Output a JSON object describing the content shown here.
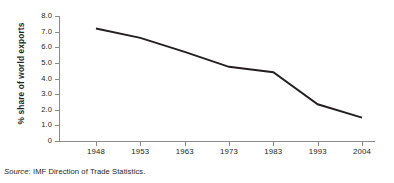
{
  "chart_data": {
    "type": "line",
    "title": "",
    "xlabel": "",
    "ylabel": "% share of world exports",
    "categories": [
      "1948",
      "1953",
      "1963",
      "1973",
      "1983",
      "1993",
      "2004"
    ],
    "values": [
      7.2,
      6.6,
      5.7,
      4.75,
      4.4,
      2.35,
      1.5
    ],
    "series": [
      {
        "name": "% share of world exports",
        "values": [
          7.2,
          6.6,
          5.7,
          4.75,
          4.4,
          2.35,
          1.5
        ]
      }
    ],
    "ylim": [
      0,
      8.0
    ],
    "y_ticks": [
      "8.0",
      "7.0",
      "6.0",
      "5.0",
      "4.0",
      "3.0",
      "2.0",
      "1.0",
      "0"
    ],
    "y_tick_values": [
      8.0,
      7.0,
      6.0,
      5.0,
      4.0,
      3.0,
      2.0,
      1.0,
      0
    ],
    "grid": false,
    "legend": "none",
    "line_color": "#231f20",
    "axis_color": "#8a8a8a"
  },
  "source": {
    "label": "Source",
    "separator": ":",
    "text": "IMF Direction of Trade Statistics."
  }
}
